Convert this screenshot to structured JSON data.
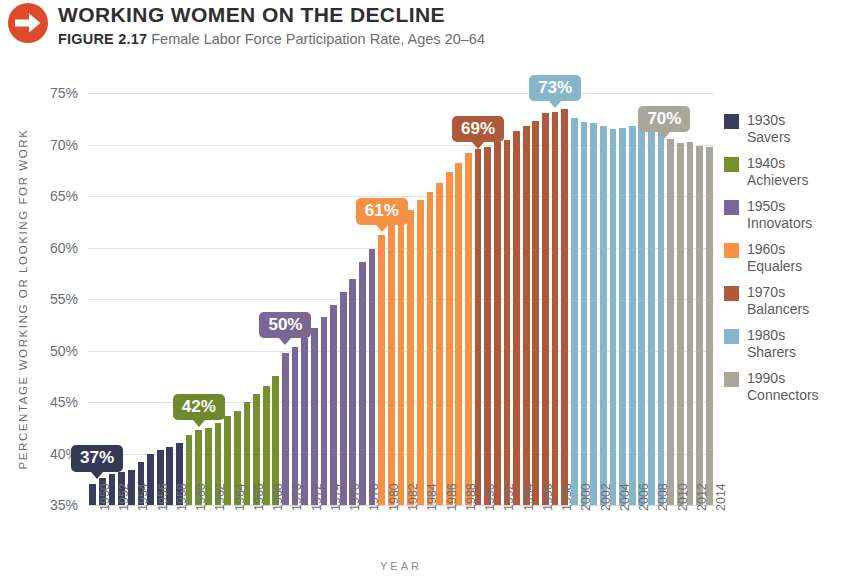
{
  "header": {
    "icon": "arrow-right-circle-icon",
    "icon_color": "#dd4b2b",
    "title": "WORKING WOMEN ON THE DECLINE",
    "figure_label": "FIGURE 2.17",
    "subtitle": "Female Labor Force Participation Rate, Ages 20–64"
  },
  "legend": {
    "items": [
      {
        "label_top": "1930s",
        "label_bottom": "Savers",
        "color": "#3b3d5c"
      },
      {
        "label_top": "1940s",
        "label_bottom": "Achievers",
        "color": "#76902f"
      },
      {
        "label_top": "1950s",
        "label_bottom": "Innovators",
        "color": "#7a6796"
      },
      {
        "label_top": "1960s",
        "label_bottom": "Equalers",
        "color": "#f79143"
      },
      {
        "label_top": "1970s",
        "label_bottom": "Balancers",
        "color": "#b0593b"
      },
      {
        "label_top": "1980s",
        "label_bottom": "Sharers",
        "color": "#87b6cb"
      },
      {
        "label_top": "1990s",
        "label_bottom": "Connectors",
        "color": "#a8a79a"
      }
    ]
  },
  "chart_data": {
    "type": "bar",
    "title": "WORKING WOMEN ON THE DECLINE",
    "subtitle": "Female Labor Force Participation Rate, Ages 20–64",
    "xlabel": "YEAR",
    "ylabel": "PERCENTAGE WORKING OR LOOKING FOR WORK",
    "ylim": [
      35,
      75
    ],
    "yticks": [
      "35%",
      "40%",
      "45%",
      "50%",
      "55%",
      "60%",
      "65%",
      "70%",
      "75%"
    ],
    "ytick_values": [
      35,
      40,
      45,
      50,
      55,
      60,
      65,
      70,
      75
    ],
    "grid": true,
    "legend_position": "right",
    "xtick_step": 2,
    "categories": [
      1950,
      1951,
      1952,
      1953,
      1954,
      1955,
      1956,
      1957,
      1958,
      1959,
      1960,
      1961,
      1962,
      1963,
      1964,
      1965,
      1966,
      1967,
      1968,
      1969,
      1970,
      1971,
      1972,
      1973,
      1974,
      1975,
      1976,
      1977,
      1978,
      1979,
      1980,
      1981,
      1982,
      1983,
      1984,
      1985,
      1986,
      1987,
      1988,
      1989,
      1990,
      1991,
      1992,
      1993,
      1994,
      1995,
      1996,
      1997,
      1998,
      1999,
      2000,
      2001,
      2002,
      2003,
      2004,
      2005,
      2006,
      2007,
      2008,
      2009,
      2010,
      2011,
      2012,
      2013,
      2014
    ],
    "values": [
      37.0,
      37.6,
      38.0,
      38.2,
      38.4,
      39.2,
      40.0,
      40.3,
      40.6,
      41.0,
      41.8,
      42.3,
      42.5,
      43.0,
      43.6,
      44.1,
      45.0,
      45.8,
      46.6,
      47.5,
      49.8,
      50.3,
      51.2,
      52.2,
      53.3,
      54.4,
      55.7,
      56.9,
      58.6,
      59.9,
      61.2,
      62.2,
      62.9,
      63.6,
      64.6,
      65.4,
      66.3,
      67.3,
      68.2,
      69.2,
      69.6,
      69.8,
      70.2,
      70.4,
      71.3,
      71.8,
      72.3,
      73.1,
      73.2,
      73.4,
      72.6,
      72.2,
      72.1,
      71.8,
      71.5,
      71.6,
      71.8,
      72.0,
      72.1,
      71.5,
      70.5,
      70.1,
      70.2,
      69.9,
      69.8
    ],
    "series_groups": [
      {
        "name": "1930s Savers",
        "start_year": 1950,
        "end_year": 1959,
        "color": "#3b3d5c"
      },
      {
        "name": "1940s Achievers",
        "start_year": 1960,
        "end_year": 1969,
        "color": "#76902f"
      },
      {
        "name": "1950s Innovators",
        "start_year": 1970,
        "end_year": 1979,
        "color": "#7a6796"
      },
      {
        "name": "1960s Equalers",
        "start_year": 1980,
        "end_year": 1989,
        "color": "#f79143"
      },
      {
        "name": "1970s Balancers",
        "start_year": 1990,
        "end_year": 1999,
        "color": "#b0593b"
      },
      {
        "name": "1980s Sharers",
        "start_year": 2000,
        "end_year": 2009,
        "color": "#87b6cb"
      },
      {
        "name": "1990s Connectors",
        "start_year": 2010,
        "end_year": 2014,
        "color": "#a8a79a"
      }
    ],
    "annotations": [
      {
        "text": "37%",
        "year": 1950,
        "value": 37,
        "color": "#343a56"
      },
      {
        "text": "42%",
        "year": 1961,
        "value": 42,
        "color": "#6f8a2d"
      },
      {
        "text": "50%",
        "year": 1970,
        "value": 50,
        "color": "#7a6796"
      },
      {
        "text": "61%",
        "year": 1980,
        "value": 61,
        "color": "#f79143"
      },
      {
        "text": "69%",
        "year": 1990,
        "value": 69,
        "color": "#b0593b"
      },
      {
        "text": "73%",
        "year": 1998,
        "value": 73,
        "color": "#87b6cb"
      },
      {
        "text": "70%",
        "year": 2010,
        "value": 70,
        "color": "#a8a79a"
      }
    ]
  }
}
